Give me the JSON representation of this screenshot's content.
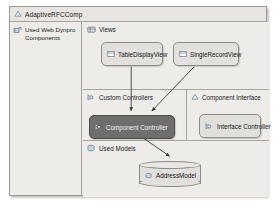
{
  "window": {
    "title": "AdaptiveRFCComp",
    "title_icon": "component-icon"
  },
  "sidebar": {
    "label": "Used Web Dynpro Components",
    "icon": "used-components-icon"
  },
  "regions": [
    {
      "key": "views",
      "title": "Views",
      "icon": "views-folder-icon"
    },
    {
      "key": "custom_controllers",
      "title": "Custom Controllers",
      "icon": "custom-controller-icon"
    },
    {
      "key": "component_interface",
      "title": "Component Interface",
      "icon": "component-interface-icon"
    },
    {
      "key": "used_models",
      "title": "Used Models",
      "icon": "used-models-icon"
    }
  ],
  "nodes": {
    "table_display_view": {
      "label": "TableDisplayView",
      "icon": "view-icon",
      "selected": false
    },
    "single_record_view": {
      "label": "SingleRecordView",
      "icon": "view-icon",
      "selected": false
    },
    "component_controller": {
      "label": "Component Controller",
      "icon": "controller-icon",
      "selected": true
    },
    "interface_controller": {
      "label": "Interface Controller",
      "icon": "controller-icon",
      "selected": false
    },
    "address_model": {
      "label": "AddressModel",
      "icon": "model-icon",
      "selected": false
    }
  },
  "connections": [
    {
      "from": "table_display_view",
      "to": "component_controller"
    },
    {
      "from": "single_record_view",
      "to": "component_controller"
    },
    {
      "from": "component_controller",
      "to": "address_model"
    }
  ],
  "colors": {
    "frame_background": "#eceae6",
    "panel_background": "#eeece8",
    "node_fill": "#e2e0dc",
    "node_border": "#8d8d87",
    "selected_fill": "#6e6e6e",
    "selected_text": "#f2f2f2",
    "divider": "#a6a6a0",
    "text": "#1a1a1a",
    "connector": "#4a4a4a"
  }
}
